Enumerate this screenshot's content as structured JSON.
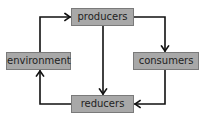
{
  "diagram": {
    "type": "cycle",
    "nodes": [
      {
        "id": "producers",
        "label": "producers"
      },
      {
        "id": "consumers",
        "label": "consumers"
      },
      {
        "id": "reducers",
        "label": "reducers"
      },
      {
        "id": "environment",
        "label": "environment"
      }
    ],
    "edges": [
      {
        "from": "producers",
        "to": "consumers"
      },
      {
        "from": "producers",
        "to": "reducers"
      },
      {
        "from": "consumers",
        "to": "reducers"
      },
      {
        "from": "reducers",
        "to": "environment"
      },
      {
        "from": "environment",
        "to": "producers"
      }
    ],
    "colors": {
      "node_fill": "#a8a8a8",
      "node_border": "#7a7a7a",
      "text": "#1e1e1e",
      "arrow": "#111111"
    }
  }
}
